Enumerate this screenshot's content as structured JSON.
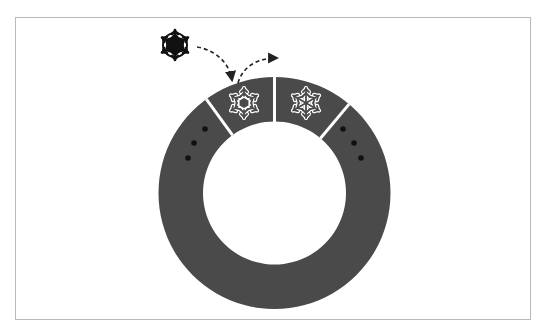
{
  "diagram": {
    "title": "Circular ring buffer with snowflake item being inserted",
    "colors": {
      "frame_border": "#b9b9b9",
      "ring_fill": "#4a4a4a",
      "divider": "#ffffff",
      "dot": "#111111",
      "external_snowflake": "#111111",
      "slot_snowflake_outline": "#ffffff",
      "arrow": "#222222"
    },
    "ring": {
      "center_x": 274.5,
      "center_y": 193,
      "outer_radius": 116,
      "inner_radius": 71.5,
      "dividers_deg": [
        -36,
        0,
        40
      ]
    },
    "slots": [
      {
        "name": "slot-left-top",
        "content": "snowflake-hexagon-icon"
      },
      {
        "name": "slot-right-top",
        "content": "snowflake-icon"
      }
    ],
    "ellipsis_left": {
      "dots": [
        [
          205,
          129
        ],
        [
          194,
          143
        ],
        [
          188,
          158
        ]
      ]
    },
    "ellipsis_right": {
      "dots": [
        [
          343,
          129
        ],
        [
          354,
          143
        ],
        [
          361,
          158
        ]
      ]
    },
    "incoming_item": {
      "icon": "snowflake-filled-icon",
      "x": 175,
      "y": 45
    },
    "arrows": [
      {
        "name": "arrow-insert",
        "description": "from incoming snowflake into first slot"
      },
      {
        "name": "arrow-advance",
        "description": "from first slot toward next slot"
      }
    ]
  }
}
